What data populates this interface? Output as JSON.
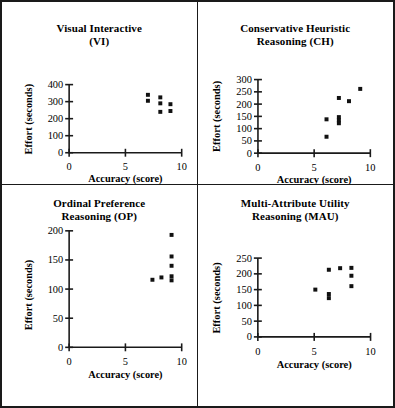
{
  "figure": {
    "panel_count": 4,
    "border_color": "#1a1a1a",
    "marker_color": "#111111",
    "background": "#ffffff"
  },
  "axis_titles": {
    "x": "Accuracy (score)",
    "y": "Effort (seconds)"
  },
  "chart_data": [
    {
      "type": "scatter",
      "id": "vi",
      "title": "Visual Interactive\n(VI)",
      "title_line1": "Visual Interactive",
      "title_line2": "(VI)",
      "xlabel": "Accuracy (score)",
      "ylabel": "Effort (seconds)",
      "xlim": [
        0,
        10
      ],
      "ylim": [
        0,
        400
      ],
      "xticks": [
        0,
        5,
        10
      ],
      "yticks": [
        0,
        100,
        200,
        300,
        400
      ],
      "grid": false,
      "legend": "none",
      "points": [
        {
          "x": 7.0,
          "y": 340
        },
        {
          "x": 7.0,
          "y": 305
        },
        {
          "x": 8.1,
          "y": 325
        },
        {
          "x": 8.1,
          "y": 290
        },
        {
          "x": 8.1,
          "y": 240
        },
        {
          "x": 9.0,
          "y": 285
        },
        {
          "x": 9.0,
          "y": 245
        }
      ]
    },
    {
      "type": "scatter",
      "id": "ch",
      "title": "Conservative Heuristic\nReasoning (CH)",
      "title_line1": "Conservative Heuristic",
      "title_line2": "Reasoning (CH)",
      "xlabel": "Accuracy (score)",
      "ylabel": "Effort (seconds)",
      "xlim": [
        0,
        10
      ],
      "ylim": [
        0,
        300
      ],
      "xticks": [
        0,
        5,
        10
      ],
      "yticks": [
        0,
        50,
        100,
        150,
        200,
        250,
        300
      ],
      "grid": false,
      "legend": "none",
      "points": [
        {
          "x": 6.1,
          "y": 138
        },
        {
          "x": 6.1,
          "y": 67
        },
        {
          "x": 7.2,
          "y": 225
        },
        {
          "x": 7.2,
          "y": 147
        },
        {
          "x": 7.2,
          "y": 134
        },
        {
          "x": 7.2,
          "y": 122
        },
        {
          "x": 8.1,
          "y": 212
        },
        {
          "x": 9.1,
          "y": 262
        }
      ]
    },
    {
      "type": "scatter",
      "id": "op",
      "title": "Ordinal Preference\nReasoning (OP)",
      "title_line1": "Ordinal Preference",
      "title_line2": "Reasoning (OP)",
      "xlabel": "Accuracy (score)",
      "ylabel": "Effort (seconds)",
      "xlim": [
        0,
        10
      ],
      "ylim": [
        0,
        200
      ],
      "xticks": [
        0,
        5,
        10
      ],
      "yticks": [
        0,
        50,
        100,
        150,
        200
      ],
      "grid": false,
      "legend": "none",
      "points": [
        {
          "x": 7.4,
          "y": 116
        },
        {
          "x": 8.2,
          "y": 120
        },
        {
          "x": 9.1,
          "y": 193
        },
        {
          "x": 9.1,
          "y": 156
        },
        {
          "x": 9.1,
          "y": 140
        },
        {
          "x": 9.1,
          "y": 122
        },
        {
          "x": 9.1,
          "y": 115
        }
      ]
    },
    {
      "type": "scatter",
      "id": "mau",
      "title": "Multi-Attribute Utility\nReasoning (MAU)",
      "title_line1": "Multi-Attribute Utility",
      "title_line2": "Reasoning (MAU)",
      "xlabel": "Accuracy (score)",
      "ylabel": "Effort (seconds)",
      "xlim": [
        0,
        10
      ],
      "ylim": [
        0,
        250
      ],
      "xticks": [
        0,
        5,
        10
      ],
      "yticks": [
        0,
        50,
        100,
        150,
        200,
        250
      ],
      "grid": false,
      "legend": "none",
      "points": [
        {
          "x": 5.1,
          "y": 150
        },
        {
          "x": 6.3,
          "y": 213
        },
        {
          "x": 6.3,
          "y": 136
        },
        {
          "x": 6.3,
          "y": 123
        },
        {
          "x": 7.3,
          "y": 218
        },
        {
          "x": 8.3,
          "y": 219
        },
        {
          "x": 8.3,
          "y": 194
        },
        {
          "x": 8.3,
          "y": 161
        }
      ]
    }
  ]
}
